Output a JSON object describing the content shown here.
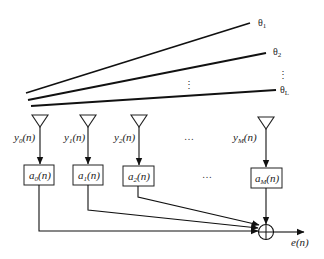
{
  "diagram": {
    "colors": {
      "stroke": "#111111",
      "background": "#ffffff"
    },
    "incident_signals": [
      {
        "label": "θ₁",
        "sym": "θ",
        "sub": "1"
      },
      {
        "label": "θ₂",
        "sym": "θ",
        "sub": "2"
      },
      {
        "label": "θL",
        "sym": "θ",
        "sub": "L"
      }
    ],
    "vertical_ellipsis": "⋮",
    "antennas": [
      {
        "signal": "y0(n)",
        "sym": "y",
        "sub": "0",
        "arg": "(n)",
        "weight": "a0(n)",
        "wsym": "a",
        "wsub": "0"
      },
      {
        "signal": "y1(n)",
        "sym": "y",
        "sub": "1",
        "arg": "(n)",
        "weight": "a1(n)",
        "wsym": "a",
        "wsub": "1"
      },
      {
        "signal": "y2(n)",
        "sym": "y",
        "sub": "2",
        "arg": "(n)",
        "weight": "a2(n)",
        "wsym": "a",
        "wsub": "2"
      },
      {
        "signal": "yM(n)",
        "sym": "y",
        "sub": "M",
        "arg": "(n)",
        "weight": "aM(n)",
        "wsym": "a",
        "wsub": "M"
      }
    ],
    "horizontal_ellipsis": "…",
    "summer": {
      "symbol": "⊕"
    },
    "output": {
      "label": "e(n)",
      "sym": "e",
      "arg": "(n)"
    }
  }
}
